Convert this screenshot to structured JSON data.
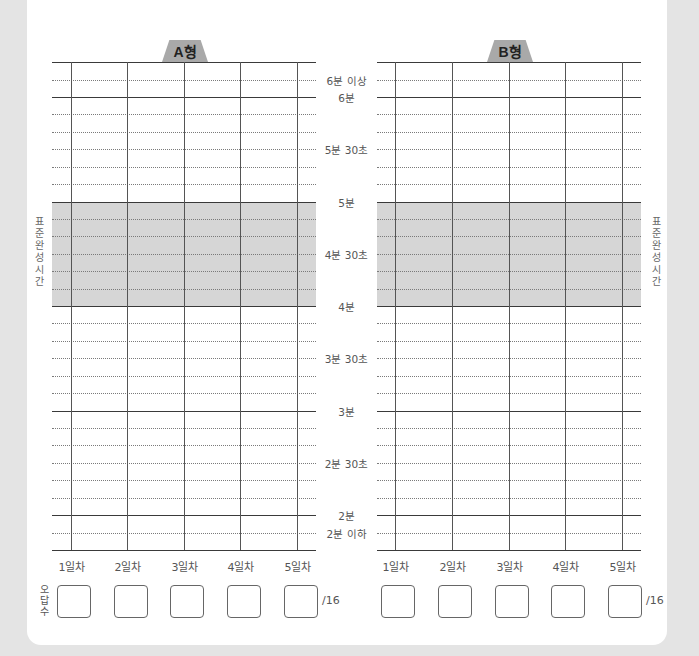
{
  "panels": [
    {
      "id": "a",
      "tab_label": "A형"
    },
    {
      "id": "b",
      "tab_label": "B형"
    }
  ],
  "y_labels": [
    {
      "label": "6분 이상",
      "y": 80
    },
    {
      "label": "6분",
      "y": 97
    },
    {
      "label": "5분 30초",
      "y": 149
    },
    {
      "label": "5분",
      "y": 202
    },
    {
      "label": "4분 30초",
      "y": 254
    },
    {
      "label": "4분",
      "y": 306
    },
    {
      "label": "3분 30초",
      "y": 358
    },
    {
      "label": "3분",
      "y": 411
    },
    {
      "label": "2분 30초",
      "y": 463
    },
    {
      "label": "2분",
      "y": 515
    },
    {
      "label": "2분 이하",
      "y": 533
    }
  ],
  "standard_time_label": "표준완성시간",
  "standard_time_range": {
    "from": "4분",
    "to": "5분"
  },
  "days": [
    "1일차",
    "2일차",
    "3일차",
    "4일차",
    "5일차"
  ],
  "wrong_answers": {
    "label": "오답수",
    "denominator": "/16",
    "a_values": [
      "",
      "",
      "",
      "",
      ""
    ],
    "b_values": [
      "",
      "",
      "",
      "",
      ""
    ]
  },
  "colors": {
    "background": "#e4e4e4",
    "sheet": "#ffffff",
    "band": "#d6d6d6",
    "tab": "#a9a9a9"
  }
}
